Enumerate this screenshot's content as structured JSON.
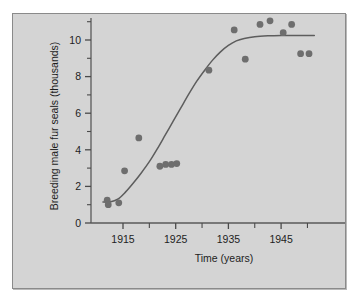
{
  "figure": {
    "panel_background": "#d4d4d4",
    "page_background": "#ffffff",
    "panel_border_color": "#8a8a8a"
  },
  "chart_data": {
    "type": "scatter",
    "title": "",
    "xlabel": "Time (years)",
    "ylabel": "Breeding male fur seals (thousands)",
    "xlim": [
      1911,
      1951.5
    ],
    "ylim": [
      0,
      11.5
    ],
    "grid": false,
    "legend": null,
    "point_color": "#6e6e6e",
    "curve_color": "#5d5d5d",
    "x_ticks_major": [
      1915,
      1925,
      1935,
      1945
    ],
    "x_ticks_major_labels": [
      "1915",
      "1925",
      "1935",
      "1945"
    ],
    "x_ticks_minor": [
      1920,
      1930,
      1940,
      1950
    ],
    "y_ticks_major": [
      0,
      2,
      4,
      6,
      8,
      10
    ],
    "y_ticks_major_labels": [
      "0",
      "2",
      "4",
      "6",
      "8",
      "10"
    ],
    "y_ticks_minor": [
      1,
      3,
      5,
      7,
      9,
      11
    ],
    "points": [
      {
        "x": 1912.0,
        "y": 1.25
      },
      {
        "x": 1912.2,
        "y": 1.0
      },
      {
        "x": 1914.2,
        "y": 1.1
      },
      {
        "x": 1915.3,
        "y": 2.85
      },
      {
        "x": 1918.0,
        "y": 4.65
      },
      {
        "x": 1922.0,
        "y": 3.1
      },
      {
        "x": 1923.1,
        "y": 3.2
      },
      {
        "x": 1924.2,
        "y": 3.2
      },
      {
        "x": 1925.2,
        "y": 3.25
      },
      {
        "x": 1931.3,
        "y": 8.35
      },
      {
        "x": 1936.1,
        "y": 10.55
      },
      {
        "x": 1938.2,
        "y": 8.95
      },
      {
        "x": 1941.0,
        "y": 10.85
      },
      {
        "x": 1942.9,
        "y": 11.05
      },
      {
        "x": 1945.4,
        "y": 10.4
      },
      {
        "x": 1947.0,
        "y": 10.85
      },
      {
        "x": 1948.7,
        "y": 9.25
      },
      {
        "x": 1950.3,
        "y": 9.25
      }
    ],
    "fitted_curve": {
      "kind": "logistic",
      "asymptote": 10.25,
      "points": [
        {
          "x": 1911.2,
          "y": 1.15
        },
        {
          "x": 1912.5,
          "y": 1.15
        },
        {
          "x": 1914.0,
          "y": 1.3
        },
        {
          "x": 1915.5,
          "y": 1.7
        },
        {
          "x": 1917.0,
          "y": 2.2
        },
        {
          "x": 1918.5,
          "y": 2.75
        },
        {
          "x": 1920.0,
          "y": 3.35
        },
        {
          "x": 1921.5,
          "y": 4.05
        },
        {
          "x": 1923.0,
          "y": 4.8
        },
        {
          "x": 1924.5,
          "y": 5.55
        },
        {
          "x": 1926.0,
          "y": 6.3
        },
        {
          "x": 1927.5,
          "y": 7.05
        },
        {
          "x": 1929.0,
          "y": 7.75
        },
        {
          "x": 1930.5,
          "y": 8.35
        },
        {
          "x": 1932.0,
          "y": 8.9
        },
        {
          "x": 1933.5,
          "y": 9.35
        },
        {
          "x": 1935.0,
          "y": 9.7
        },
        {
          "x": 1936.5,
          "y": 9.95
        },
        {
          "x": 1938.0,
          "y": 10.08
        },
        {
          "x": 1940.0,
          "y": 10.18
        },
        {
          "x": 1942.5,
          "y": 10.23
        },
        {
          "x": 1945.0,
          "y": 10.25
        },
        {
          "x": 1948.0,
          "y": 10.25
        },
        {
          "x": 1951.3,
          "y": 10.25
        }
      ]
    }
  }
}
